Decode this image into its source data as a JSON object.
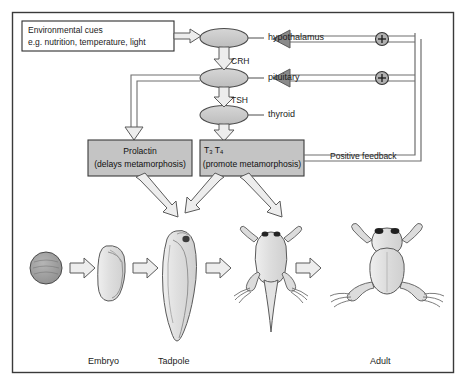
{
  "diagram": {
    "frame": {
      "name": "outer-frame"
    }
  },
  "colors": {
    "gland_fill": "#c9c9c9",
    "box_fill": "#c4c4c4",
    "arrow_fill": "#e2e2e2",
    "line": "#4a4a4a",
    "text": "#111111",
    "frame": "#333333",
    "organism_fill": "#dcdcdc",
    "egg_fill": "#9e9e9e"
  },
  "environmental_cues": {
    "line1": "Environmental cues",
    "line2": "e.g. nutrition, temperature, light"
  },
  "glands": [
    {
      "key": "hypothalamus",
      "label": "hypothalamus"
    },
    {
      "key": "pituitary",
      "label": "pituitary"
    },
    {
      "key": "thyroid",
      "label": "thyroid"
    }
  ],
  "hormone_arrow_labels": [
    {
      "key": "crh",
      "label": "CRH",
      "from": "hypothalamus",
      "to": "pituitary"
    },
    {
      "key": "tsh",
      "label": "TSH",
      "from": "pituitary",
      "to": "thyroid"
    }
  ],
  "hormone_boxes": [
    {
      "key": "prolactin",
      "line1": "Prolactin",
      "line2": "(delays metamorphosis)"
    },
    {
      "key": "thyroid-hormones",
      "line1": "T3  T4",
      "line1_html": "T<sub>3</sub>  T<sub>4</sub>",
      "line2": "(promote metamorphosis)"
    }
  ],
  "feedback": {
    "label": "Positive feedback",
    "signs": [
      {
        "key": "plus-hypothalamus",
        "symbol": "+",
        "target": "hypothalamus"
      },
      {
        "key": "plus-pituitary",
        "symbol": "+",
        "target": "pituitary"
      }
    ]
  },
  "life_cycle": {
    "stages": [
      {
        "key": "egg",
        "label": ""
      },
      {
        "key": "embryo",
        "label": "Embryo"
      },
      {
        "key": "tadpole",
        "label": "Tadpole"
      },
      {
        "key": "limbed-tadpole",
        "label": ""
      },
      {
        "key": "adult",
        "label": "Adult"
      }
    ]
  }
}
